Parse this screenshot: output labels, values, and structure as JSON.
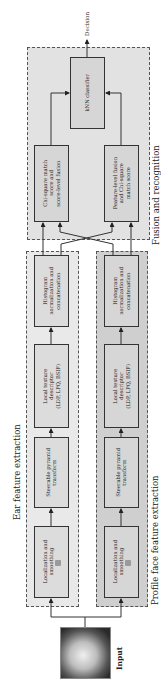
{
  "diagram": {
    "orientation": "rotated-90-ccw",
    "input": {
      "label": "Input",
      "image": "profile-face-photo"
    },
    "output": {
      "label": "Decision"
    },
    "groups": {
      "ear": {
        "label": "Ear feature extraction",
        "steps": [
          "Localization and\nsmoothing",
          "Steerable pyramid\ntransform",
          "Local texture\ndescriptor\n(LDP, LPQ, BSIF)",
          "Histogram\nnormalization and\nconcatenation"
        ]
      },
      "profile": {
        "label": "Profile face feature extraction",
        "steps": [
          "Localization and\nsmoothing",
          "Steerable pyramid\ntransform",
          "Local texture\ndescriptor\n(LDP, LPQ, BSIF)",
          "Histogram\nnormalization and\nconcatenation"
        ]
      },
      "fusion": {
        "label": "Fusion and recognition",
        "score_fusion": "Chi-square match\nscore and\nscore-level fusion",
        "feature_fusion": "Feature-level fusion\nand Chi-square\nmatch score",
        "classifier": "kNN classifier"
      }
    },
    "colors": {
      "fusion_bg": "#e2e2e2",
      "ear_bg": "#e9e9e9",
      "profile_bg": "#cfcfcf",
      "box_bg": "#d6d6d6",
      "line": "#333333"
    }
  }
}
